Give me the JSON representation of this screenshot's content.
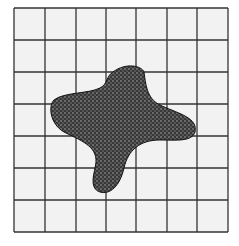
{
  "figure": {
    "grid": {
      "columns": 7,
      "rows": 7,
      "line_color": "#333333",
      "cell_fill": "#f2f2f2"
    },
    "shape": {
      "fill": "#3c3c3c",
      "pattern_dot": "#6a6a6a",
      "outline": "#111111"
    }
  }
}
